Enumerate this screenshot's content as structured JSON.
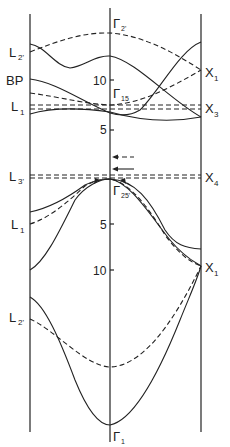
{
  "diagram": {
    "type": "band-structure",
    "panels": [
      "L",
      "Γ",
      "X"
    ],
    "left_labels": {
      "L2p_top": "L",
      "L2p_top_sub": "2'",
      "BP": "BP",
      "L1_top": "L",
      "L1_top_sub": "1",
      "L3p": "L",
      "L3p_sub": "3'",
      "L1_mid": "L",
      "L1_mid_sub": "1",
      "L2p_bot": "L",
      "L2p_bot_sub": "2'"
    },
    "center_labels": {
      "gamma2p": "Γ",
      "gamma2p_sub": "2'",
      "gamma15": "Γ",
      "gamma15_sub": "15",
      "gamma25p": "Γ",
      "gamma25p_sub": "25'",
      "gamma1": "Γ",
      "gamma1_sub": "1"
    },
    "right_labels": {
      "X1_top": "X",
      "X1_top_sub": "1",
      "X3": "X",
      "X3_sub": "3",
      "X4": "X",
      "X4_sub": "4",
      "X1_bot": "X",
      "X1_bot_sub": "1"
    },
    "axis_ticks": {
      "upper": [
        "10",
        "5"
      ],
      "lower": [
        "5",
        "10"
      ]
    },
    "colors": {
      "line": "#222222",
      "background": "#ffffff"
    }
  }
}
